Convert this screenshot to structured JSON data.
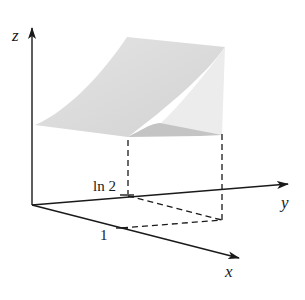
{
  "figure": {
    "type": "3d-surface-over-rectangle",
    "axes": {
      "x": {
        "label": "x",
        "tick_label": "1"
      },
      "y": {
        "label": "y",
        "tick_label": "ln 2"
      },
      "z": {
        "label": "z"
      }
    },
    "colors": {
      "axis": "#1a1a1a",
      "surface_top": "#d9d9d9",
      "surface_side": "#ececec",
      "surface_under": "#c4c4c4",
      "background": "#ffffff"
    }
  }
}
